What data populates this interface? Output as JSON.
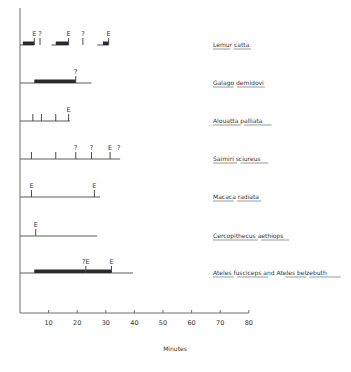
{
  "chart_data": {
    "type": "timeline",
    "title": "",
    "xlabel": "Minutes",
    "ylabel": "",
    "xlim": [
      0,
      80
    ],
    "xticks": [
      10,
      20,
      30,
      40,
      50,
      60,
      70,
      80
    ],
    "grid": false,
    "legend": "none",
    "marker_legend": {
      "E": "ejaculation",
      "?": "uncertain",
      "?E": "possible ejaculation"
    },
    "rows": [
      {
        "species": "Lemur catta",
        "species_words": [
          "Lemur",
          "catta"
        ],
        "segments": [
          [
            0,
            5
          ],
          [
            11,
            17
          ],
          [
            27,
            31
          ]
        ],
        "bars": [
          [
            1,
            5
          ],
          [
            12.5,
            17
          ],
          [
            29,
            31
          ]
        ],
        "markers": [
          {
            "x": 5,
            "label": "E"
          },
          {
            "x": 7,
            "label": "?"
          },
          {
            "x": 17,
            "label": "E"
          },
          {
            "x": 22,
            "label": "?"
          },
          {
            "x": 31,
            "label": "E"
          }
        ]
      },
      {
        "species": "Galago demidovi",
        "species_words": [
          "Galago",
          "demidovi"
        ],
        "segments": [
          [
            0,
            25
          ]
        ],
        "bars": [
          [
            5,
            19.5
          ]
        ],
        "markers": [
          {
            "x": 19.5,
            "label": "?"
          }
        ]
      },
      {
        "species": "Alouatta palliata",
        "species_words": [
          "Alouatta",
          "palliata"
        ],
        "segments": [
          [
            0,
            17.5
          ]
        ],
        "bars": [],
        "markers": [
          {
            "x": 4.5,
            "label": ""
          },
          {
            "x": 7.5,
            "label": ""
          },
          {
            "x": 12.5,
            "label": ""
          },
          {
            "x": 17,
            "label": "E"
          }
        ]
      },
      {
        "species": "Saimiri sciureus",
        "species_words": [
          "Saimiri",
          "sciureus"
        ],
        "segments": [
          [
            0,
            35
          ]
        ],
        "bars": [],
        "markers": [
          {
            "x": 4,
            "label": ""
          },
          {
            "x": 12.5,
            "label": ""
          },
          {
            "x": 19.5,
            "label": "?"
          },
          {
            "x": 25,
            "label": "?"
          },
          {
            "x": 31.5,
            "label": "E"
          },
          {
            "x": 34.5,
            "label": "?",
            "tick": false
          }
        ]
      },
      {
        "species": "Macaca radiata",
        "species_words": [
          "Macaca",
          "radiata"
        ],
        "segments": [
          [
            0,
            28
          ]
        ],
        "bars": [],
        "markers": [
          {
            "x": 4,
            "label": "E"
          },
          {
            "x": 26,
            "label": "E"
          }
        ]
      },
      {
        "species": "Cercopithecus aethiops",
        "species_words": [
          "Cercopithecus",
          "aethiops"
        ],
        "segments": [
          [
            0,
            27
          ]
        ],
        "bars": [],
        "markers": [
          {
            "x": 5.5,
            "label": "E"
          }
        ]
      },
      {
        "species": "Ateles fusciceps and Ateles belzebuth",
        "species_words": [
          "Ateles",
          "fusciceps",
          "and",
          "Ateles",
          "belzebuth"
        ],
        "underlined_words": [
          true,
          true,
          false,
          true,
          true
        ],
        "segments": [
          [
            0,
            39.5
          ]
        ],
        "bars": [
          [
            5,
            32
          ]
        ],
        "markers": [
          {
            "x": 23,
            "label": "?E"
          },
          {
            "x": 32,
            "label": "E"
          }
        ]
      }
    ]
  }
}
